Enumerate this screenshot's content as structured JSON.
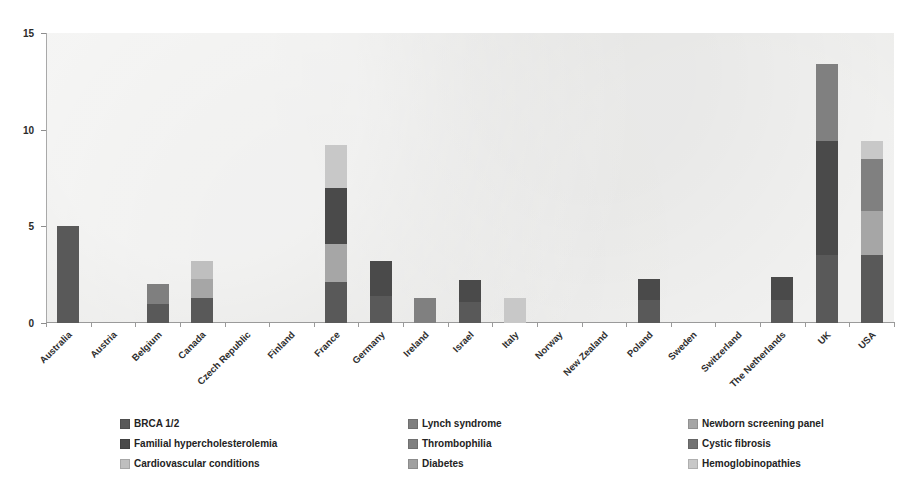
{
  "chart_data": {
    "type": "bar",
    "subtype": "stacked-vertical",
    "title": "",
    "xlabel": "",
    "ylabel": "",
    "ylim": [
      0,
      15
    ],
    "yticks": [
      0,
      5,
      10,
      15
    ],
    "ytick_labels": [
      "0",
      "5",
      "10",
      "15"
    ],
    "grid": false,
    "legend_position": "bottom",
    "categories": [
      "Australia",
      "Austria",
      "Belgium",
      "Canada",
      "Czech Republic",
      "Finland",
      "France",
      "Germany",
      "Ireland",
      "Israel",
      "Italy",
      "Norway",
      "New Zealand",
      "Poland",
      "Sweden",
      "Switzerland",
      "The Netherlands",
      "UK",
      "USA"
    ],
    "series": [
      {
        "name": "BRCA 1/2",
        "color": "#595959",
        "values": [
          5,
          0,
          1,
          1.3,
          0,
          0,
          2.1,
          1.4,
          0,
          1.1,
          0,
          0,
          0,
          1.2,
          0,
          0,
          1.2,
          3.5,
          3.5
        ]
      },
      {
        "name": "Lynch syndrome",
        "color": "#7f7f7f",
        "values": [
          0,
          0,
          1,
          0,
          0,
          0,
          0,
          0,
          0,
          0,
          0,
          0,
          0,
          0,
          0,
          0,
          0,
          0,
          0
        ]
      },
      {
        "name": "Newborn screening panel",
        "color": "#a6a6a6",
        "values": [
          0,
          0,
          0,
          1,
          0,
          0,
          2,
          0,
          0,
          0,
          0,
          0,
          0,
          0,
          0,
          0,
          0,
          0,
          2.3
        ]
      },
      {
        "name": "Familial hypercholesterolemia",
        "color": "#4a4a4a",
        "values": [
          0,
          0,
          0,
          0,
          0,
          0,
          2.9,
          1.8,
          0,
          1.1,
          0,
          0,
          0,
          1.1,
          0,
          0,
          1.2,
          5.9,
          0
        ]
      },
      {
        "name": "Thrombophilia",
        "color": "#808080",
        "values": [
          0,
          0,
          0,
          0,
          0,
          0,
          0,
          0,
          1.3,
          0,
          0,
          0,
          0,
          0,
          0,
          0,
          0,
          4,
          2.7
        ]
      },
      {
        "name": "Cystic fibrosis",
        "color": "#737373",
        "values": [
          0,
          0,
          0,
          0,
          0,
          0,
          0,
          0,
          0,
          0,
          0,
          0,
          0,
          0,
          0,
          0,
          0,
          0,
          0
        ]
      },
      {
        "name": "Cardiovascular conditions",
        "color": "#bfbfbf",
        "values": [
          0,
          0,
          0,
          0.9,
          0,
          0,
          0,
          0,
          0,
          0,
          0,
          0,
          0,
          0,
          0,
          0,
          0,
          0,
          0
        ]
      },
      {
        "name": "Diabetes",
        "color": "#a0a0a0",
        "values": [
          0,
          0,
          0,
          0,
          0,
          0,
          0,
          0,
          0,
          0,
          0,
          0,
          0,
          0,
          0,
          0,
          0,
          0,
          0
        ]
      },
      {
        "name": "Hemoglobinopathies",
        "color": "#c8c8c8",
        "values": [
          0,
          0,
          0,
          0,
          0,
          0,
          2.2,
          0,
          0,
          0,
          1.3,
          0,
          0,
          0,
          0,
          0,
          0,
          0,
          0.9
        ]
      }
    ],
    "totals": [
      5,
      0,
      2,
      3.2,
      0,
      0,
      9.2,
      3.2,
      1.3,
      2.2,
      1.3,
      0,
      0,
      2.3,
      0,
      0,
      2.4,
      13.4,
      9.4
    ]
  },
  "legend": {
    "items": [
      {
        "label": "BRCA 1/2",
        "color": "#595959"
      },
      {
        "label": "Lynch syndrome",
        "color": "#7f7f7f"
      },
      {
        "label": "Newborn screening panel",
        "color": "#a6a6a6"
      },
      {
        "label": "Familial hypercholesterolemia",
        "color": "#4a4a4a"
      },
      {
        "label": "Thrombophilia",
        "color": "#808080"
      },
      {
        "label": "Cystic fibrosis",
        "color": "#737373"
      },
      {
        "label": "Cardiovascular conditions",
        "color": "#bfbfbf"
      },
      {
        "label": "Diabetes",
        "color": "#a0a0a0"
      },
      {
        "label": "Hemoglobinopathies",
        "color": "#c8c8c8"
      }
    ]
  },
  "style": {
    "plot_background": "#e8e8e6",
    "page_background": "#ffffff",
    "axis_color": "#9a9a9a",
    "text_color": "#2b2b2b"
  }
}
